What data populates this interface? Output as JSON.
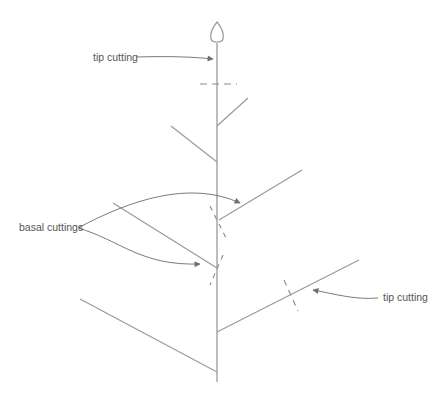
{
  "diagram": {
    "type": "plant-cuttings-illustration",
    "colors": {
      "stem": "#9a9a9a",
      "arrow": "#6e6e6e",
      "text": "#555555",
      "background": "#ffffff"
    },
    "labels": {
      "tip_top": "tip cutting",
      "basal": "basal cuttings",
      "tip_right": "tip cutting"
    }
  }
}
